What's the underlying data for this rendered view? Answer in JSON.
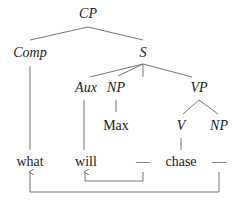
{
  "diagram": {
    "type": "syntax-tree",
    "nodes": {
      "cp": "CP",
      "comp": "Comp",
      "s": "S",
      "aux": "Aux",
      "np_subject": "NP",
      "vp": "VP",
      "v": "V",
      "np_object": "NP"
    },
    "words": {
      "what": "what",
      "will": "will",
      "gap_aux": "—",
      "max": "Max",
      "chase": "chase",
      "gap_object": "—"
    },
    "movements": [
      {
        "from": "gap_aux",
        "to": "will"
      },
      {
        "from": "gap_object",
        "to": "what"
      }
    ],
    "colors": {
      "text": "#222222",
      "lines": "#777777"
    }
  }
}
